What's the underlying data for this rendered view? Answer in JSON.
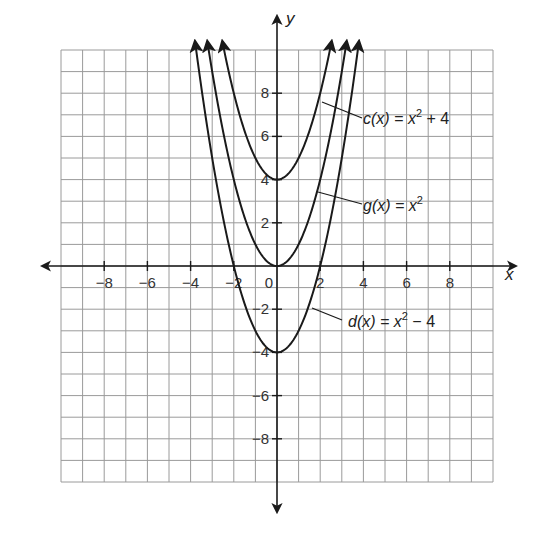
{
  "chart_data": {
    "type": "line",
    "title": "",
    "xlabel": "x",
    "ylabel": "y",
    "xlim": [
      -10,
      10
    ],
    "ylim": [
      -10,
      10
    ],
    "grid": true,
    "grid_step": 1,
    "x_ticks": [
      -8,
      -6,
      -4,
      -2,
      0,
      2,
      4,
      6,
      8
    ],
    "y_ticks": [
      -8,
      -6,
      -4,
      -2,
      2,
      4,
      6,
      8
    ],
    "x_tick_labels": [
      "−8",
      "−6",
      "−4",
      "−2",
      "0",
      "2",
      "4",
      "6",
      "8"
    ],
    "y_tick_labels": [
      "−8",
      "−6",
      "−4",
      "−2",
      "2",
      "4",
      "6",
      "8"
    ],
    "series": [
      {
        "name": "c(x) = x² + 4",
        "fn": "c",
        "expr": "x^2 + 4",
        "offset": 4,
        "vertex": [
          0,
          4
        ],
        "label_parts": {
          "pre": "c(x) = x",
          "sup": "2",
          "post": " + 4"
        }
      },
      {
        "name": "g(x) = x²",
        "fn": "g",
        "expr": "x^2",
        "offset": 0,
        "vertex": [
          0,
          0
        ],
        "label_parts": {
          "pre": "g(x) = x",
          "sup": "2",
          "post": ""
        }
      },
      {
        "name": "d(x) = x² − 4",
        "fn": "d",
        "expr": "x^2 - 4",
        "offset": -4,
        "vertex": [
          0,
          -4
        ],
        "label_parts": {
          "pre": "d(x) = x",
          "sup": "2",
          "post": " − 4"
        }
      }
    ],
    "legend_position": "inline annotations with leader lines"
  },
  "labels": {
    "x_axis": "x",
    "y_axis": "y",
    "c_pre": "c(x) = x",
    "c_sup": "2",
    "c_post": " + 4",
    "g_pre": "g(x) = x",
    "g_sup": "2",
    "g_post": "",
    "d_pre": "d(x) = x",
    "d_sup": "2",
    "d_post": " − 4"
  },
  "colors": {
    "grid": "#9a9a9a",
    "axis": "#1a1a1a",
    "curve": "#1a1a1a",
    "background": "#ffffff"
  }
}
